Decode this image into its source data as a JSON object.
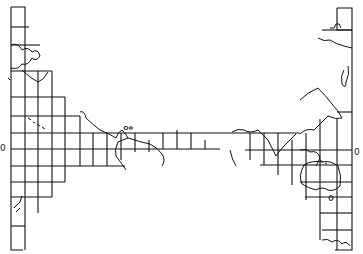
{
  "map": {
    "type": "interrupted world map outline with graticule grid",
    "ink_color": "#111111",
    "background": "#ffffff",
    "equator_label_left": "0",
    "equator_label_right": "0",
    "left_panel": {
      "region": "Americas / Pacific",
      "features": [
        "North America west coast",
        "Hawaiian Islands",
        "Central America",
        "South America north coast",
        "New Zealand (south-west)"
      ]
    },
    "right_panel": {
      "region": "Asia / Australia",
      "features": [
        "East Asia",
        "Japan",
        "India",
        "Southeast Asia",
        "Australia",
        "Tasmania",
        "Antarctic coast",
        "Africa east coast"
      ]
    }
  }
}
